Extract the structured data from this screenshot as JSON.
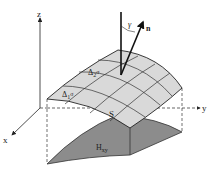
{
  "diagram": {
    "axes": {
      "x": "x",
      "y": "y",
      "z": "z"
    },
    "surface_label": "S",
    "patch1": {
      "base": "Δ",
      "sub": "1",
      "sym": "σ"
    },
    "patch2": {
      "base": "Δ",
      "sub": "2",
      "sym": "σ"
    },
    "projection": {
      "base": "H",
      "sub": "xy"
    },
    "normal_label": "n",
    "angle_label": "γ",
    "colors": {
      "surface": "#d9d9d9",
      "projection": "#8c8c8c",
      "lines": "#222222"
    }
  }
}
